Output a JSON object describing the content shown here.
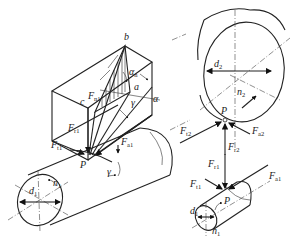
{
  "top_fragment": [
    "a2",
    "n1",
    "n2"
  ],
  "left_assembly": {
    "labels": {
      "b": "b",
      "c": "c",
      "a": "a",
      "alpha_n": {
        "base": "α",
        "sub": "n"
      },
      "alpha": "α",
      "gamma_box": "γ",
      "Fn1": {
        "base": "F",
        "sub": "n1"
      },
      "Fr1": {
        "base": "F",
        "sub": "r1"
      },
      "Ft1": {
        "base": "F",
        "sub": "t1"
      },
      "Fa1": {
        "base": "F",
        "sub": "a1"
      },
      "P": "P",
      "gamma_cyl": "γ",
      "d1": {
        "base": "d",
        "sub": "1"
      },
      "n1": {
        "base": "n",
        "sub": "1"
      }
    }
  },
  "gear_wheel": {
    "labels": {
      "d2": {
        "base": "d",
        "sub": "2"
      },
      "n2": {
        "base": "n",
        "sub": "2"
      },
      "P": "P",
      "Ft2": {
        "base": "F",
        "sub": "t2"
      },
      "Fa2": {
        "base": "F",
        "sub": "a2"
      },
      "Fr2": {
        "base": "F",
        "sub": "r2"
      }
    }
  },
  "small_pinion": {
    "labels": {
      "Fr1": {
        "base": "F",
        "sub": "r1"
      },
      "Ft1": {
        "base": "F",
        "sub": "t1"
      },
      "Fa1": {
        "base": "F",
        "sub": "a1"
      },
      "P": "P",
      "d1": {
        "base": "d",
        "sub": "1"
      },
      "n1": {
        "base": "n",
        "sub": "1"
      }
    }
  }
}
